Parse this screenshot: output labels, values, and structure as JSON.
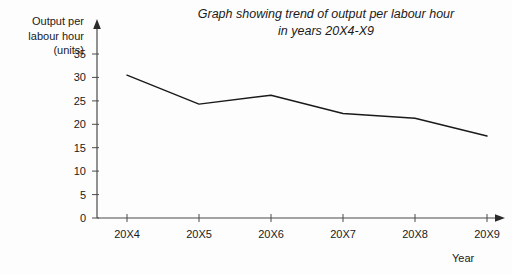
{
  "chart_data": {
    "type": "line",
    "title": "Graph showing trend of output per labour hour in years 20X4-X9",
    "title_lines": [
      "Graph showing trend of output per labour hour",
      "in years 20X4-X9"
    ],
    "xlabel": "Year",
    "ylabel": "Output per labour hour (units)",
    "ylabel_lines": [
      "Output per",
      "labour hour",
      "(units)"
    ],
    "categories": [
      "20X4",
      "20X5",
      "20X6",
      "20X7",
      "20X8",
      "20X9"
    ],
    "values": [
      30.5,
      24.3,
      26.2,
      22.3,
      21.3,
      17.5
    ],
    "series": [
      {
        "name": "Output per labour hour",
        "values": [
          30.5,
          24.3,
          26.2,
          22.3,
          21.3,
          17.5
        ]
      }
    ],
    "yticks": [
      0,
      5,
      10,
      15,
      20,
      25,
      30,
      35
    ],
    "ylim": [
      0,
      35
    ],
    "grid": false,
    "legend": false,
    "line_color": "#1a1a1a",
    "axis_color": "#4a4a4a",
    "background_color": "#fdfdfd"
  },
  "labels": {
    "y0": "0",
    "y5": "5",
    "y10": "10",
    "y15": "15",
    "y20": "20",
    "y25": "25",
    "y30": "30",
    "y35": "35",
    "x0": "20X4",
    "x1": "20X5",
    "x2": "20X6",
    "x3": "20X7",
    "x4": "20X8",
    "x5": "20X9",
    "xaxis_name": "Year",
    "ylabel_0": "Output per",
    "ylabel_1": "labour hour",
    "ylabel_2": "(units)",
    "title_0": "Graph showing trend of output per labour hour",
    "title_1": "in years 20X4-X9"
  }
}
